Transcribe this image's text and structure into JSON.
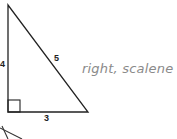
{
  "diagram": {
    "shape": "right triangle",
    "side_labels": {
      "left": "4",
      "hypotenuse": "5",
      "bottom": "3"
    },
    "right_angle_marker": true,
    "annotation": "right, scalene",
    "colors": {
      "lines": "#222222",
      "handwriting": "#8a8a8a"
    }
  }
}
